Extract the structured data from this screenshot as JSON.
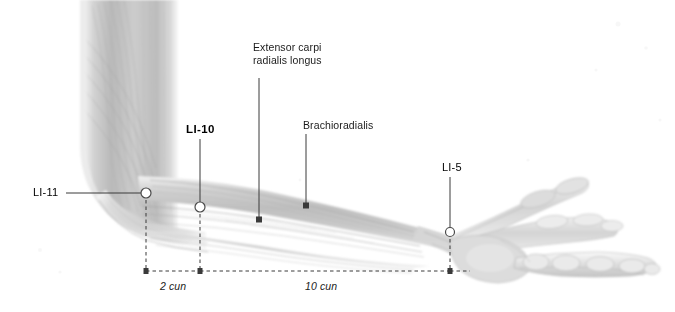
{
  "figure": {
    "type": "anatomical-illustration",
    "background_color": "#ffffff",
    "line_color": "#3a3a3a",
    "text_color": "#1a1a1a"
  },
  "muscle_labels": [
    {
      "id": "extensor-carpi-radialis-longus",
      "text": "Extensor carpi\nradialis longus",
      "x": 253,
      "y": 44,
      "leader": {
        "x1": 259,
        "y1": 78,
        "x2": 259,
        "y2": 220
      }
    },
    {
      "id": "brachioradialis",
      "text": "Brachioradialis",
      "x": 303,
      "y": 121,
      "leader": {
        "x1": 306,
        "y1": 134,
        "x2": 306,
        "y2": 206
      }
    }
  ],
  "acupoints": [
    {
      "id": "li-11",
      "label": "LI-11",
      "bold": false,
      "label_x": 33,
      "label_y": 186,
      "point_x": 146,
      "point_y": 193,
      "leader": {
        "x1": 66,
        "y1": 193,
        "x2": 141,
        "y2": 193
      }
    },
    {
      "id": "li-10",
      "label": "LI-10",
      "bold": true,
      "label_x": 186,
      "label_y": 123,
      "point_x": 200,
      "point_y": 207,
      "leader": {
        "x1": 200,
        "y1": 139,
        "x2": 200,
        "y2": 202
      }
    },
    {
      "id": "li-5",
      "label": "LI-5",
      "bold": false,
      "label_x": 442,
      "label_y": 163,
      "point_x": 450,
      "point_y": 232,
      "leader": {
        "x1": 450,
        "y1": 177,
        "x2": 450,
        "y2": 228
      }
    }
  ],
  "measurements": [
    {
      "id": "measure-2-cun",
      "text": "2 cun",
      "text_x": 160,
      "text_y": 286,
      "line_y": 271,
      "from_x": 146,
      "to_x": 200,
      "drop_from": {
        "x": 146,
        "y1": 200,
        "y2": 271
      },
      "drop_to": {
        "x": 200,
        "y1": 214,
        "y2": 271
      }
    },
    {
      "id": "measure-10-cun",
      "text": "10 cun",
      "text_x": 305,
      "text_y": 286,
      "line_y": 271,
      "from_x": 200,
      "to_x": 450,
      "drop_from": {
        "x": 200,
        "y1": 214,
        "y2": 271
      },
      "drop_to": {
        "x": 450,
        "y1": 239,
        "y2": 271
      }
    }
  ]
}
